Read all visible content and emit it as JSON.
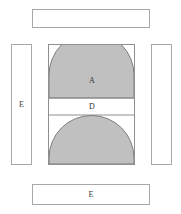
{
  "diagram": {
    "background_color": "#ffffff",
    "fill_color": "#c0c0c0",
    "stroke_color": "#8f8f8f",
    "panel_stroke_color": "#a8a8a8",
    "text_color": "#2f2f2f",
    "panels": [
      {
        "position": "top",
        "label": ""
      },
      {
        "position": "left",
        "label": "E"
      },
      {
        "position": "right",
        "label": ""
      },
      {
        "position": "bottom",
        "label": "E"
      }
    ],
    "core": {
      "regions": [
        {
          "id": "upper-dome",
          "label": "A",
          "shape": "dome",
          "fill": "#c0c0c0"
        },
        {
          "id": "middle-band",
          "label": "D",
          "shape": "rectangle",
          "fill": "#ffffff"
        },
        {
          "id": "lower-semicircle",
          "label": "",
          "shape": "semicircle",
          "fill": "#c0c0c0"
        }
      ]
    }
  }
}
